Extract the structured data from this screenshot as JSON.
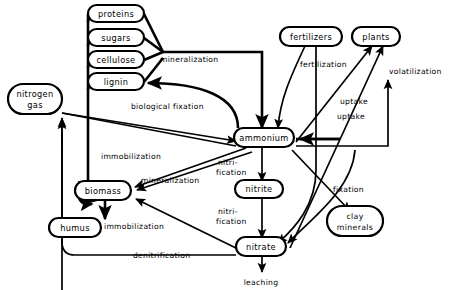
{
  "diagram": {
    "type": "flow-diagram",
    "background_color": "#ffffff",
    "line_color": "#000000",
    "nodes": [
      {
        "id": "proteins",
        "label": "proteins",
        "label2": "",
        "x": 116,
        "y": 14,
        "w": 56,
        "h": 17
      },
      {
        "id": "sugars",
        "label": "sugars",
        "label2": "",
        "x": 116,
        "y": 38,
        "w": 56,
        "h": 17
      },
      {
        "id": "cellulose",
        "label": "cellulose",
        "label2": "",
        "x": 116,
        "y": 60,
        "w": 56,
        "h": 17
      },
      {
        "id": "lignin",
        "label": "lignin",
        "label2": "",
        "x": 116,
        "y": 82,
        "w": 56,
        "h": 17
      },
      {
        "id": "nitrogen-gas",
        "label": "nitrogen",
        "label2": "gas",
        "x": 35,
        "y": 99,
        "w": 54,
        "h": 30
      },
      {
        "id": "biomass",
        "label": "biomass",
        "label2": "",
        "x": 103,
        "y": 190,
        "w": 56,
        "h": 19
      },
      {
        "id": "humus",
        "label": "humus",
        "label2": "",
        "x": 75,
        "y": 227,
        "w": 52,
        "h": 19
      },
      {
        "id": "ammonium",
        "label": "ammonium",
        "label2": "",
        "x": 264,
        "y": 137,
        "w": 60,
        "h": 19
      },
      {
        "id": "nitrite",
        "label": "nitrite",
        "label2": "",
        "x": 259,
        "y": 189,
        "w": 48,
        "h": 18
      },
      {
        "id": "nitrate",
        "label": "nitrate",
        "label2": "",
        "x": 261,
        "y": 246,
        "w": 50,
        "h": 19
      },
      {
        "id": "fertilizers",
        "label": "fertilizers",
        "label2": "",
        "x": 311,
        "y": 36,
        "w": 62,
        "h": 19
      },
      {
        "id": "plants",
        "label": "plants",
        "label2": "",
        "x": 376,
        "y": 36,
        "w": 48,
        "h": 19
      },
      {
        "id": "clay-minerals",
        "label": "clay",
        "label2": "minerals",
        "x": 355,
        "y": 221,
        "w": 56,
        "h": 30
      }
    ],
    "edge_labels": [
      {
        "id": "mineralization-om",
        "text": "mineralization",
        "x": 160,
        "y": 62,
        "anchor": "start"
      },
      {
        "id": "biological-fixation",
        "text": "biological fixation",
        "x": 131,
        "y": 109,
        "anchor": "start"
      },
      {
        "id": "fertilization",
        "text": "fertilization",
        "x": 300,
        "y": 67,
        "anchor": "start"
      },
      {
        "id": "volatilization",
        "text": "volatilization",
        "x": 389,
        "y": 74,
        "anchor": "start"
      },
      {
        "id": "uptake-1",
        "text": "uptake",
        "x": 340,
        "y": 104,
        "anchor": "start"
      },
      {
        "id": "uptake-2",
        "text": "uptake",
        "x": 337,
        "y": 119,
        "anchor": "start"
      },
      {
        "id": "immobilization-top",
        "text": "immobilization",
        "x": 101,
        "y": 159,
        "anchor": "start"
      },
      {
        "id": "mineralization-bio",
        "text": "mineralization",
        "x": 141,
        "y": 183,
        "anchor": "start"
      },
      {
        "id": "immobilization-bot",
        "text": "immobilization",
        "x": 104,
        "y": 229,
        "anchor": "start"
      },
      {
        "id": "denitrification",
        "text": "denitrification",
        "x": 133,
        "y": 258,
        "anchor": "start"
      },
      {
        "id": "nitrification-1a",
        "text": "nitri-",
        "x": 218,
        "y": 165,
        "anchor": "start"
      },
      {
        "id": "nitrification-1b",
        "text": "fication",
        "x": 216,
        "y": 175,
        "anchor": "start"
      },
      {
        "id": "nitrification-2a",
        "text": "nitri-",
        "x": 218,
        "y": 214,
        "anchor": "start"
      },
      {
        "id": "nitrification-2b",
        "text": "fication",
        "x": 216,
        "y": 224,
        "anchor": "start"
      },
      {
        "id": "fixation",
        "text": "fixation",
        "x": 333,
        "y": 192,
        "anchor": "start"
      },
      {
        "id": "leaching",
        "text": "leaching",
        "x": 261,
        "y": 281,
        "anchor": "middle"
      }
    ]
  }
}
